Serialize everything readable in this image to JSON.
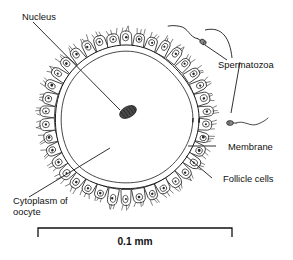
{
  "figure": {
    "kind": "biological-diagram",
    "background_color": "#ffffff",
    "ink_color": "#1a1a1a"
  },
  "labels": {
    "nucleus": "Nucleus",
    "spermatozoa": "Spermatozoa",
    "membrane": "Membrane",
    "follicle_cells": "Follicle cells",
    "cytoplasm_line1": "Cytoplasm of",
    "cytoplasm_line2": "oocyte"
  },
  "scale_bar": {
    "value": "0.1 mm",
    "x_start": 38,
    "x_end": 232,
    "y": 228,
    "cap_height": 9
  },
  "oocyte": {
    "center_x": 126,
    "center_y": 118,
    "outer_radius": 72,
    "inner_radius": 66,
    "nucleus": {
      "cx": 128,
      "cy": 112,
      "rx": 9,
      "ry": 5.5,
      "rotation": -28
    }
  },
  "follicle_ring": {
    "count": 38,
    "cell_width": 11.5,
    "cell_height": 13.5,
    "spike_count": 3
  },
  "spermatozoa": [
    {
      "name": "upper-spermatozoon",
      "head_x": 203,
      "head_y": 42,
      "angle": 212
    },
    {
      "name": "lower-spermatozoon",
      "head_x": 230,
      "head_y": 123,
      "angle": 0
    }
  ],
  "leaders": {
    "nucleus": {
      "x1": 33,
      "y1": 22,
      "x2": 120,
      "y2": 110
    },
    "cytoplasm": {
      "x1": 29,
      "y1": 197,
      "x2": 110,
      "y2": 148
    },
    "membrane": {
      "x1": 216,
      "y1": 146,
      "x2": 188,
      "y2": 146
    },
    "follicle_cells": {
      "x1": 212,
      "y1": 178,
      "x2": 186,
      "y2": 156
    },
    "spermatozoa_upper": {
      "x1": 227,
      "y1": 60,
      "x2": 205,
      "y2": 45
    },
    "spermatozoa_lower": {
      "x1": 240,
      "y1": 62,
      "x2": 231,
      "y2": 113
    }
  }
}
